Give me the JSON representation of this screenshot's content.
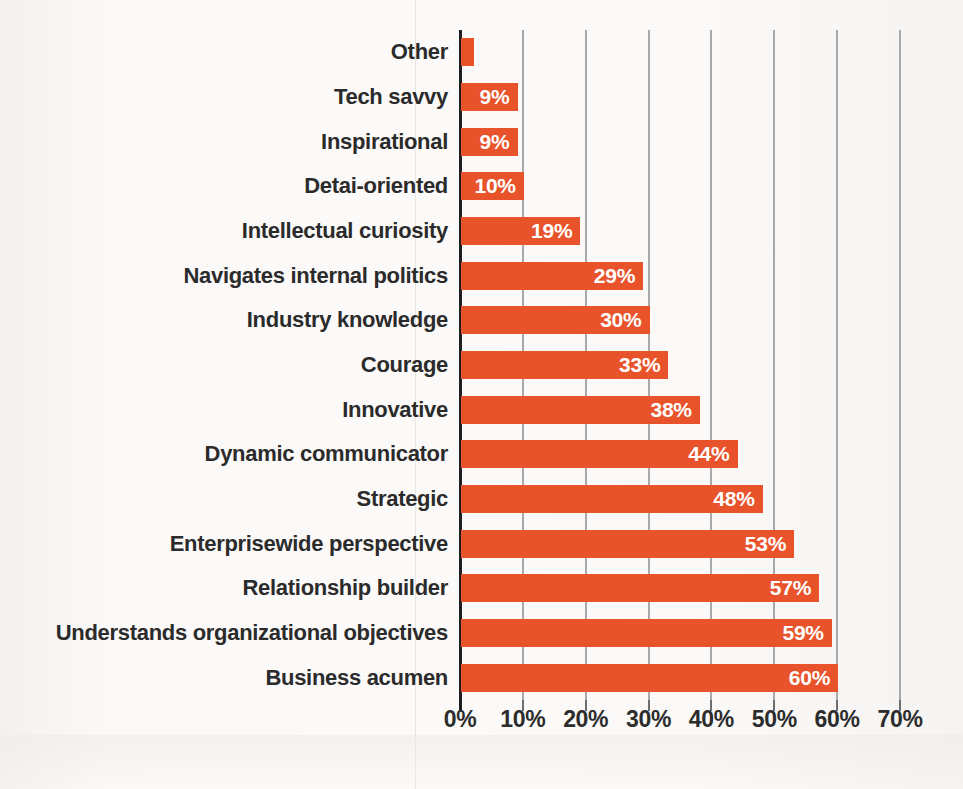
{
  "chart_data": {
    "type": "bar",
    "orientation": "horizontal",
    "title": "",
    "subtitle": "",
    "xlabel": "",
    "ylabel": "",
    "xlim": [
      0,
      70
    ],
    "xtick_labels": [
      "0%",
      "10%",
      "20%",
      "30%",
      "40%",
      "50%",
      "60%",
      "70%"
    ],
    "xticks": [
      0,
      10,
      20,
      30,
      40,
      50,
      60,
      70
    ],
    "grid": "vertical",
    "legend": "none",
    "bar_color": "#e8532b",
    "label_color": "#ffffff",
    "category_color": "#2b2b2b",
    "background": "#fbfaf9",
    "categories": [
      "Other",
      "Tech savvy",
      "Inspirational",
      "Detai-oriented",
      "Intellectual curiosity",
      "Navigates internal politics",
      "Industry knowledge",
      "Courage",
      "Innovative",
      "Dynamic communicator",
      "Strategic",
      "Enterprisewide perspective",
      "Relationship builder",
      "Understands organizational objectives",
      "Business acumen"
    ],
    "values": [
      2,
      9,
      9,
      10,
      19,
      29,
      30,
      33,
      38,
      44,
      48,
      53,
      57,
      59,
      60
    ],
    "data_labels": [
      "",
      "9%",
      "9%",
      "10%",
      "19%",
      "29%",
      "30%",
      "33%",
      "38%",
      "44%",
      "48%",
      "53%",
      "57%",
      "59%",
      "60%"
    ]
  }
}
